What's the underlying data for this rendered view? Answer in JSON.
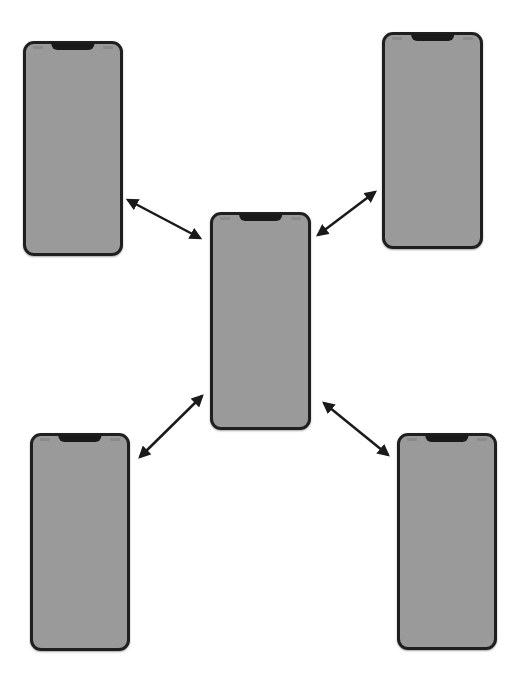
{
  "diagram": {
    "type": "hub-and-spoke",
    "colors": {
      "screen": "#9a9a9a",
      "frame": "#1f1f1f",
      "arrow": "#1a1a1a",
      "background": "#ffffff"
    },
    "nodes": [
      {
        "id": "phone-top-left",
        "x": 23,
        "y": 41,
        "w": 100,
        "h": 215
      },
      {
        "id": "phone-top-right",
        "x": 382,
        "y": 32,
        "w": 101,
        "h": 217
      },
      {
        "id": "phone-center",
        "x": 210,
        "y": 212,
        "w": 101,
        "h": 218
      },
      {
        "id": "phone-bottom-left",
        "x": 30,
        "y": 433,
        "w": 100,
        "h": 218
      },
      {
        "id": "phone-bottom-right",
        "x": 397,
        "y": 433,
        "w": 100,
        "h": 217
      }
    ],
    "edges": [
      {
        "from": "phone-center",
        "to": "phone-top-left",
        "direction": "bidirectional",
        "x1": 128,
        "y1": 200,
        "x2": 200,
        "y2": 238
      },
      {
        "from": "phone-center",
        "to": "phone-top-right",
        "direction": "bidirectional",
        "x1": 318,
        "y1": 235,
        "x2": 375,
        "y2": 192
      },
      {
        "from": "phone-center",
        "to": "phone-bottom-left",
        "direction": "bidirectional",
        "x1": 140,
        "y1": 457,
        "x2": 202,
        "y2": 396
      },
      {
        "from": "phone-center",
        "to": "phone-bottom-right",
        "direction": "bidirectional",
        "x1": 324,
        "y1": 403,
        "x2": 388,
        "y2": 455
      }
    ]
  }
}
